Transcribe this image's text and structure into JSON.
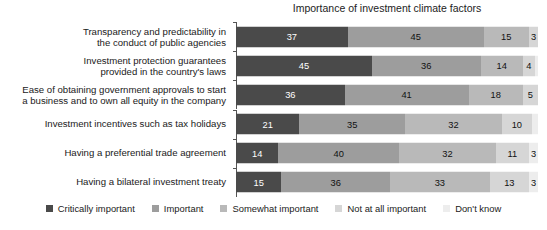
{
  "chart_data": {
    "type": "bar",
    "orientation": "horizontal",
    "stacked": true,
    "stack_mode": "percent",
    "title": "Importance of investment climate factors",
    "xlabel": "",
    "ylabel": "",
    "xlim": [
      0,
      100
    ],
    "grid": false,
    "legend_position": "bottom",
    "categories": [
      "Transparency and predictability in\nthe conduct of public agencies",
      "Investment protection guarantees\nprovided in the country's laws",
      "Ease of obtaining government approvals to start\na business and to own all equity in the company",
      "Investment incentives such as tax holidays",
      "Having a preferential trade agreement",
      "Having a bilateral investment treaty"
    ],
    "series": [
      {
        "name": "Critically important",
        "color": "#4a4a4a",
        "values": [
          37,
          45,
          36,
          21,
          14,
          15
        ]
      },
      {
        "name": "Important",
        "color": "#9d9d9d",
        "values": [
          45,
          36,
          41,
          35,
          40,
          36
        ]
      },
      {
        "name": "Somewhat important",
        "color": "#b9b9b9",
        "values": [
          15,
          14,
          18,
          32,
          32,
          33
        ]
      },
      {
        "name": "Not at all important",
        "color": "#d6d6d6",
        "values": [
          3,
          4,
          5,
          10,
          11,
          13
        ]
      },
      {
        "name": "Don't know",
        "color": "#ededed",
        "values": [
          0,
          1,
          0,
          2,
          3,
          3
        ]
      }
    ],
    "value_labels_hidden_below": 3
  },
  "legend": {
    "items": [
      {
        "label": "Critically important",
        "color": "#4a4a4a"
      },
      {
        "label": "Important",
        "color": "#9d9d9d"
      },
      {
        "label": "Somewhat important",
        "color": "#b9b9b9"
      },
      {
        "label": "Not at all important",
        "color": "#d6d6d6"
      },
      {
        "label": "Don't know",
        "color": "#ededed"
      }
    ]
  }
}
